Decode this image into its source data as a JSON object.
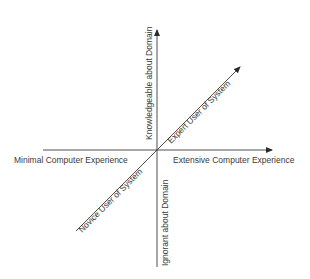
{
  "diagram": {
    "axes": {
      "horizontal": {
        "left_label": "Minimal Computer Experience",
        "right_label": "Extensive Computer Experience"
      },
      "vertical": {
        "top_label": "Knowledgeable about Domain",
        "bottom_label": "Ignorant about Domain"
      },
      "diagonal": {
        "upper_label": "Expert User of System",
        "lower_label": "Novice User of System"
      }
    },
    "colors": {
      "line": "#3a3a3a",
      "background": "#ffffff"
    }
  }
}
